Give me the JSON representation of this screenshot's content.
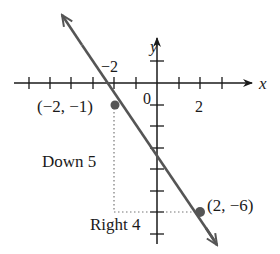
{
  "graph": {
    "x_axis_label": "x",
    "y_axis_label": "y",
    "origin_label": "0",
    "tick_label_neg2": "−2",
    "tick_label_2": "2",
    "points": [
      {
        "label": "(−2, −1)",
        "x": -2,
        "y": -1
      },
      {
        "label": "(2, −6)",
        "x": 2,
        "y": -6
      }
    ],
    "annotations": {
      "rise": "Down 5",
      "run": "Right 4"
    },
    "colors": {
      "line": "#555555",
      "axes": "#1a1a1a",
      "point": "#555555",
      "guide": "#777777"
    }
  }
}
